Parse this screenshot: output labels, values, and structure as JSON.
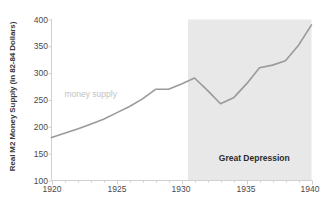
{
  "chart_data": {
    "type": "line",
    "title": "",
    "xlabel": "",
    "ylabel": "Real M2 Money Supply (in 82-84 Dollars)",
    "xlim": [
      1920,
      1940
    ],
    "ylim": [
      100,
      400
    ],
    "grid": false,
    "legend": "none",
    "x_ticks": [
      "1920",
      "1925",
      "1930",
      "1935",
      "1940"
    ],
    "y_ticks": [
      "100",
      "150",
      "200",
      "250",
      "300",
      "350",
      "400"
    ],
    "series": [
      {
        "name": "money supply",
        "color": "#9a9a9a",
        "x": [
          1920,
          1921,
          1922,
          1923,
          1924,
          1925,
          1926,
          1927,
          1928,
          1929,
          1930,
          1931,
          1932,
          1933,
          1934,
          1935,
          1936,
          1937,
          1938,
          1939,
          1940
        ],
        "values": [
          180,
          188,
          196,
          205,
          214,
          226,
          238,
          252,
          270,
          270,
          280,
          291,
          268,
          243,
          254,
          280,
          310,
          315,
          323,
          352,
          390
        ]
      }
    ],
    "annotations": [
      {
        "name": "money-supply-label",
        "text": "money supply",
        "x": 1923.0,
        "y": 262,
        "color": "#c2c2c2"
      },
      {
        "name": "great-depression-label",
        "text": "Great Depression",
        "x": 1935.6,
        "y": 142,
        "color": "#2b2b2b"
      }
    ],
    "shaded_regions": [
      {
        "name": "great-depression-band",
        "label": "Great Depression",
        "x_start": 1930.5,
        "x_end": 1940,
        "color": "#e8e8e8"
      }
    ],
    "axis_color": "#d0d0d0",
    "background": "#ffffff"
  }
}
